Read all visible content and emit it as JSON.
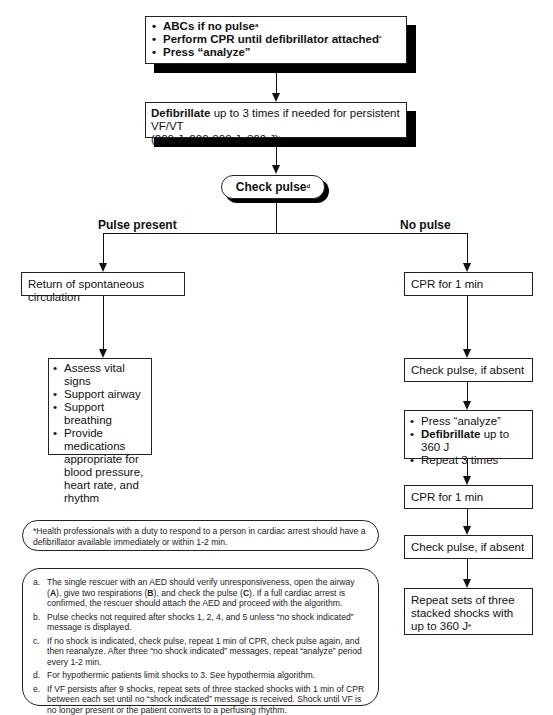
{
  "flowchart": {
    "start_box": {
      "items": [
        {
          "text": "ABCs if no pulse",
          "sup": "a"
        },
        {
          "text": "Perform CPR until defibrillator attached",
          "sup": "*"
        },
        {
          "text": "Press “analyze”",
          "sup": ""
        }
      ]
    },
    "defib_box": {
      "bold": "Defibrillate",
      "text": " up to 3 times if needed for persistent VF/VT",
      "line2": "(200 J, 200-300 J, 360 J)",
      "sup": "b,c"
    },
    "check_pulse": {
      "text": "Check pulse",
      "sup": "d"
    },
    "branches": {
      "left_label": "Pulse present",
      "right_label": "No pulse"
    },
    "left": {
      "rosc_box": "Return of spontaneous circulation",
      "care_box": {
        "items": [
          "Assess vital signs",
          "Support airway",
          "Support breathing",
          "Provide medications appropriate for blood pressure, heart rate, and rhythm"
        ]
      }
    },
    "right": {
      "cpr_1": "CPR for 1 min",
      "check_1": "Check pulse, if absent",
      "shock_box": {
        "item1": "Press “analyze”",
        "item2_bold": "Defibrillate",
        "item2_rest": " up to 360 J",
        "item3": "Repeat 3 times"
      },
      "cpr_2": "CPR for 1 min",
      "check_2": "Check pulse, if absent",
      "repeat_box": {
        "text": "Repeat sets of three stacked shocks with up to 360 J",
        "sup": "e"
      }
    }
  },
  "notes": {
    "asterisk_note": "*Health professionals with a duty to respond to a person in cardiac arrest should have a defibrillator available immediately or within 1-2 min.",
    "footnotes": [
      {
        "letter": "a.",
        "text_parts": [
          "The single rescuer with an AED should verify unresponsiveness, open the airway (",
          "A",
          "), give two respirations (",
          "B",
          "), and check the pulse (",
          "C",
          "). If a full cardiac arrest is confirmed, the rescuer should attach the AED and proceed with the algorithm."
        ]
      },
      {
        "letter": "b.",
        "text": "Pulse checks not required after shocks 1, 2, 4, and 5 unless “no shock indicated” message is displayed."
      },
      {
        "letter": "c.",
        "text": "If no shock is indicated, check pulse, repeat 1 min of CPR, check pulse again, and then reanalyze. After three “no shock indicated” messages, repeat “analyze” period every 1-2 min."
      },
      {
        "letter": "d.",
        "text": "For hypothermic patients limit shocks to 3. See hypothermia algorithm."
      },
      {
        "letter": "e.",
        "text": "If VF persists after 9 shocks, repeat sets of three stacked shocks with 1 min of CPR between each set until no “shock indicated” message is received. Shock until VF is no longer present or the patient converts to a perfusing rhythm."
      }
    ]
  }
}
